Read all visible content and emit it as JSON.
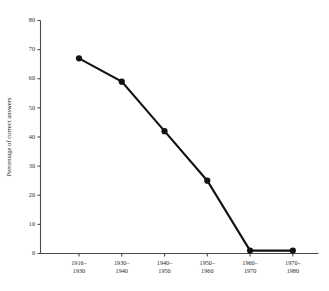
{
  "chart_data": {
    "type": "line",
    "title": "",
    "xlabel": "",
    "ylabel": "Percentage of correct answers",
    "categories": [
      "1916–1930",
      "1930–1940",
      "1940–1950",
      "1950–1960",
      "1960–1970",
      "1970–1980"
    ],
    "category_lines": [
      [
        "1916–",
        "1930"
      ],
      [
        "1930–",
        "1940"
      ],
      [
        "1940–",
        "1950"
      ],
      [
        "1950–",
        "1960"
      ],
      [
        "1960–",
        "1970"
      ],
      [
        "1970–",
        "1980"
      ]
    ],
    "values": [
      67,
      59,
      42,
      25,
      1,
      1
    ],
    "ylim": [
      0,
      80
    ],
    "yticks": [
      0,
      10,
      20,
      30,
      40,
      50,
      60,
      70,
      80
    ],
    "ytick_labels": [
      "0",
      "10",
      "20",
      "30",
      "40",
      "50",
      "60",
      "70",
      "80"
    ],
    "grid": false,
    "legend": null,
    "legend_position": "none",
    "marker": "circle",
    "line_color": "#111111",
    "marker_color": "#111111",
    "axis_color": "#4a4a4a",
    "background_color": "#ffffff"
  }
}
